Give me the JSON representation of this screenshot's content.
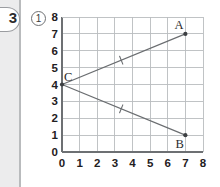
{
  "page": {
    "problem_number": "3",
    "sub_item": "1",
    "sub_item_style": "circled"
  },
  "colors": {
    "paper": "#ffffff",
    "margin_band": "#ececed",
    "binding_rule": "#b9bbbd",
    "grid_line": "#b9bcbf",
    "axis_line": "#6d7073",
    "plot_line": "#6a6d70",
    "point_fill": "#3c3f42",
    "text": "#1f2022"
  },
  "chart_data": {
    "type": "scatter",
    "title": "",
    "xlabel": "",
    "ylabel": "",
    "xlim": [
      0,
      8
    ],
    "ylim": [
      0,
      8
    ],
    "xticks": [
      "0",
      "1",
      "2",
      "3",
      "4",
      "5",
      "6",
      "7",
      "8"
    ],
    "yticks": [
      "0",
      "1",
      "2",
      "3",
      "4",
      "5",
      "6",
      "7",
      "8"
    ],
    "grid": true,
    "grid_step": 1,
    "legend": "none",
    "points": [
      {
        "label": "A",
        "x": 7,
        "y": 7,
        "label_pos": "above-left"
      },
      {
        "label": "B",
        "x": 7,
        "y": 1,
        "label_pos": "below-left"
      },
      {
        "label": "C",
        "x": 0,
        "y": 4,
        "label_pos": "above-right"
      }
    ],
    "segments": [
      {
        "name": "CA",
        "from": "C",
        "to": "A",
        "x1": 0,
        "y1": 4,
        "x2": 7,
        "y2": 7,
        "tick_marks": 1
      },
      {
        "name": "CB",
        "from": "C",
        "to": "B",
        "x1": 0,
        "y1": 4,
        "x2": 7,
        "y2": 1,
        "tick_marks": 1
      }
    ],
    "annotations": [
      {
        "type": "congruence-tick",
        "on": "CA",
        "count": 1
      },
      {
        "type": "congruence-tick",
        "on": "CB",
        "count": 1
      }
    ]
  }
}
